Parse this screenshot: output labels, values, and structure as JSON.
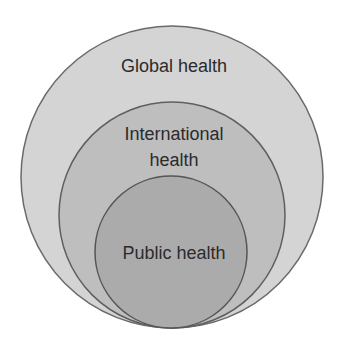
{
  "diagram": {
    "type": "nested-circles",
    "circles": [
      {
        "id": "outer",
        "label": "Global health",
        "fill": "#d3d3d3",
        "stroke": "#6a6a6a"
      },
      {
        "id": "middle",
        "label_line1": "International",
        "label_line2": "health",
        "fill": "#bdbdbd",
        "stroke": "#5f5f5f"
      },
      {
        "id": "inner",
        "label": "Public health",
        "fill": "#a9a9a9",
        "stroke": "#555555"
      }
    ]
  }
}
